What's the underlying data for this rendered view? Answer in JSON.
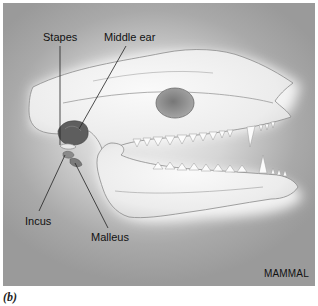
{
  "figure": {
    "caption": "(b)",
    "panel_title": "MAMMAL",
    "labels": {
      "stapes": "Stapes",
      "middle_ear": "Middle ear",
      "incus": "Incus",
      "malleus": "Malleus"
    },
    "colors": {
      "background_dark": "#9a9a9a",
      "background_light": "#eeeeee",
      "bone": "#f2f2f2",
      "bone_outline": "#8a8a8a",
      "middle_ear": "#5e5e5e",
      "ear_bones": "#7a7a7a",
      "leader_lines": "#222222",
      "text": "#111111"
    }
  }
}
